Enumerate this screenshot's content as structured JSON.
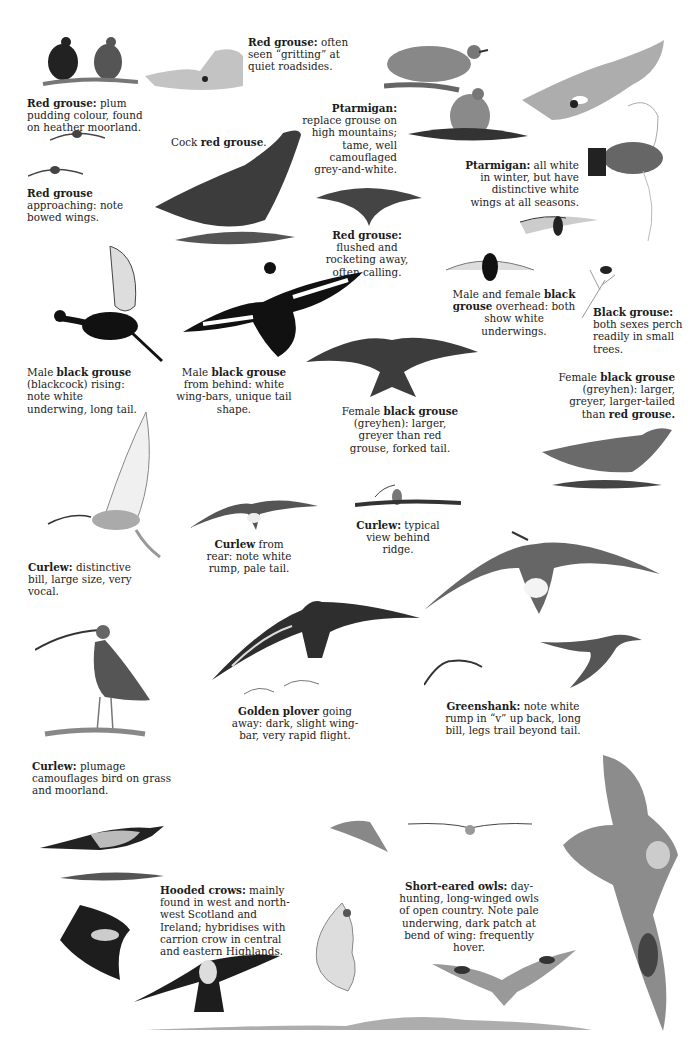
{
  "plate": {
    "captions": [
      {
        "id": "red-grouse-plum",
        "bold": "Red grouse:",
        "text": " plum pudding colour, found on heather moorland."
      },
      {
        "id": "red-grouse-gritting",
        "bold": "Red grouse:",
        "text": " often seen “gritting” at quiet roadsides."
      },
      {
        "id": "ptarmigan-replace",
        "bold": "Ptarmigan:",
        "text": " replace grouse on high mountains; tame, well camouflaged grey-and-white."
      },
      {
        "id": "cock-red-grouse",
        "pre": "Cock ",
        "bold": "red grouse",
        "text": "."
      },
      {
        "id": "red-grouse-approaching",
        "bold": "Red grouse",
        "text": " approaching: note bowed wings."
      },
      {
        "id": "ptarmigan-winter",
        "bold": "Ptarmigan:",
        "text": " all white in winter, but have distinctive white wings at all seasons."
      },
      {
        "id": "red-grouse-flushed",
        "bold": "Red grouse:",
        "text": " flushed and rocketing away, often calling."
      },
      {
        "id": "black-grouse-overhead",
        "pre": "Male and female ",
        "bold": "black grouse",
        "text": " overhead: both show white underwings."
      },
      {
        "id": "black-grouse-perch",
        "bold": "Black grouse:",
        "text": " both sexes perch readily in small trees."
      },
      {
        "id": "blackcock-rising",
        "pre": "Male ",
        "bold": "black grouse",
        "text": " (blackcock) rising: note white underwing, long tail."
      },
      {
        "id": "blackcock-behind",
        "pre": "Male ",
        "bold": "black grouse",
        "text": " from behind: white wing-bars, unique tail shape."
      },
      {
        "id": "greyhen-right",
        "pre": "Female ",
        "bold": "black grouse",
        "text": " (greyhen): larger, greyer, larger-tailed than ",
        "bold2": "red grouse",
        "post": "."
      },
      {
        "id": "greyhen-flight",
        "pre": "Female ",
        "bold": "black grouse",
        "text": " (greyhen): larger, greyer than red grouse, forked tail."
      },
      {
        "id": "curlew-ridge",
        "bold": "Curlew:",
        "text": " typical view behind ridge."
      },
      {
        "id": "curlew-rear",
        "bold": "Curlew",
        "text": " from rear: note white rump, pale tail."
      },
      {
        "id": "curlew-bill",
        "bold": "Curlew:",
        "text": " distinctive bill, large size, very vocal."
      },
      {
        "id": "golden-plover",
        "bold": "Golden plover",
        "text": " going away: dark, slight wing-bar, very rapid flight."
      },
      {
        "id": "greenshank",
        "bold": "Greenshank:",
        "text": " note white rump in “v” up back, long bill, legs trail beyond tail."
      },
      {
        "id": "curlew-plumage",
        "bold": "Curlew:",
        "text": " plumage camouflages bird on grass and moorland."
      },
      {
        "id": "hooded-crows",
        "bold": "Hooded crows:",
        "text": " mainly found in west and north-west Scotland and Ireland; hybridises with carrion crow in central and eastern Highlands."
      },
      {
        "id": "short-eared-owls",
        "bold": "Short-eared owls:",
        "text": " day-hunting, long-winged owls of open country. Note pale underwing, dark patch at bend of wing: frequently hover."
      }
    ],
    "illustrations": [
      "red-grouse-pair",
      "red-grouse-roadside",
      "ptarmigan-standing",
      "ptarmigan-sitting",
      "ptarmigan-hillside",
      "red-grouse-flight-small",
      "red-grouse-approaching",
      "cock-red-grouse",
      "red-grouse-flushed",
      "ptarmigan-winter-flight",
      "black-grouse-overhead-pair",
      "black-grouse-in-tree",
      "blackcock-rising",
      "blackcock-behind",
      "greyhen-flight",
      "greyhen-standing",
      "curlew-rising",
      "curlew-rear",
      "curlew-ridge",
      "greenshank-overhead",
      "curlew-standing",
      "golden-plover",
      "golden-plover-distant",
      "greenshank-small",
      "greenshank-flight",
      "hooded-crow-perched",
      "hooded-crow-flight",
      "hooded-crow-overhead",
      "short-eared-owl-large",
      "short-eared-owl-banking",
      "short-eared-owl-distant",
      "short-eared-owl-hover",
      "short-eared-owl-front"
    ]
  }
}
